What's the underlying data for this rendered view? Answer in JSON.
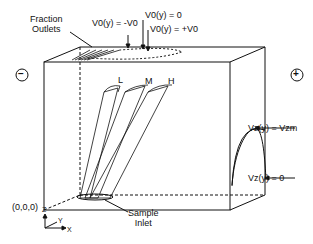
{
  "diagram": {
    "type": "3D free-flow electrophoresis chamber schematic",
    "labels": {
      "fraction_outlets": [
        "Fraction",
        "Outlets"
      ],
      "v0_neg": "V0(y) = -V0",
      "v0_zero": "V0(y) = 0",
      "v0_pos": "V0(y) = +V0",
      "vz_max": "Vz(y) = Vzm",
      "vz_zero": "Vz(y) = 0",
      "origin": "(0,0,0)",
      "sample_inlet": [
        "Sample",
        "Inlet"
      ],
      "minus_electrode": "−",
      "plus_electrode": "+",
      "band_L": "L",
      "band_M": "M",
      "band_H": "H",
      "axis_z": "Z",
      "axis_y": "Y",
      "axis_x": "X"
    }
  }
}
